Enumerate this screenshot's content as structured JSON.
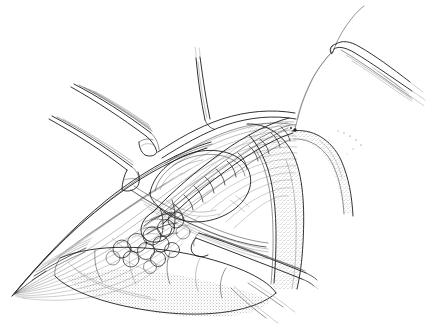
{
  "figure": {
    "domain": "Natural-Image",
    "medium": "pen-and-ink line drawing",
    "background_color": "#ffffff",
    "ink_color": "#1b1b1b",
    "mid_ink_color": "#3a3a3a",
    "light_ink_color": "#6a6a6a",
    "faint_ink_color": "#8a8a8a",
    "width_px": 431,
    "height_px": 329,
    "has_text_labels": false,
    "caption": ""
  },
  "elements": {
    "retractor_upper_left_outer": "retractor-blade-upper-left-outer",
    "retractor_upper_left_inner": "retractor-blade-upper-left-inner",
    "retractor_top_center": "retractor-probe-top-center",
    "retractor_lower_right": "retractor-blade-lower-right",
    "needle": "curved-surgical-needle",
    "suture_thread": "suture-thread",
    "suture_line": "running-suture-line",
    "tubular_viscus": "tubular-viscus",
    "stippled_tube_right": "stippled-curved-tube",
    "stippled_tube_bottom": "stippled-bowel-loop",
    "fat_lobules": "lobulated-fat-tissue",
    "wound_apex_left": "wound-apex-left",
    "muscle_flap_upper": "muscle-flap-upper",
    "muscle_flap_lower": "muscle-flap-lower",
    "anchor_threads": "anchor-stay-sutures"
  }
}
